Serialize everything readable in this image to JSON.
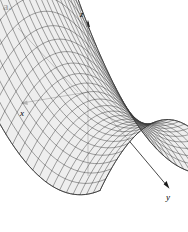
{
  "figure": {
    "panel_label": "a.",
    "background_color": "#ffffff",
    "ink_color": "#000000",
    "mesh_color": "#3a3a3a",
    "surface_fill": "#e8e8e8",
    "width": 188,
    "height": 232
  },
  "chart_data": {
    "type": "surface",
    "title": "",
    "subtitle": "",
    "surface_equation": "z = y^2 - x^2",
    "surface_name": "hyperbolic paraboloid (saddle)",
    "projection": "oblique 3D axonometric",
    "grid": true,
    "legend": false,
    "axes": [
      {
        "name": "x-axis",
        "label": "x",
        "direction": "toward lower-left, arrowhead at far end",
        "arrow": true
      },
      {
        "name": "y-axis",
        "label": "y",
        "direction": "toward lower-right, arrowhead at far end",
        "arrow": true
      },
      {
        "name": "z-axis",
        "label": "z",
        "direction": "vertical, upward, arrowhead at top",
        "arrow": true
      }
    ],
    "axis_labels": {
      "x": "x",
      "y": "y",
      "z": "z"
    },
    "tick_labels": {
      "x": [],
      "y": [],
      "z": []
    },
    "annotations": [
      {
        "text": "a.",
        "position": "top-left",
        "role": "panel-letter"
      }
    ],
    "mesh": {
      "u_lines": 22,
      "v_lines": 22,
      "u_range": [
        -1,
        1
      ],
      "v_range": [
        -1,
        1
      ],
      "saddle_point": [
        0,
        0,
        0
      ]
    },
    "xlim": [
      -1,
      1
    ],
    "ylim": [
      -1,
      1
    ],
    "zlim": [
      -1,
      1
    ]
  },
  "axis_labels": {
    "x": "x",
    "y": "y",
    "z": "z"
  }
}
